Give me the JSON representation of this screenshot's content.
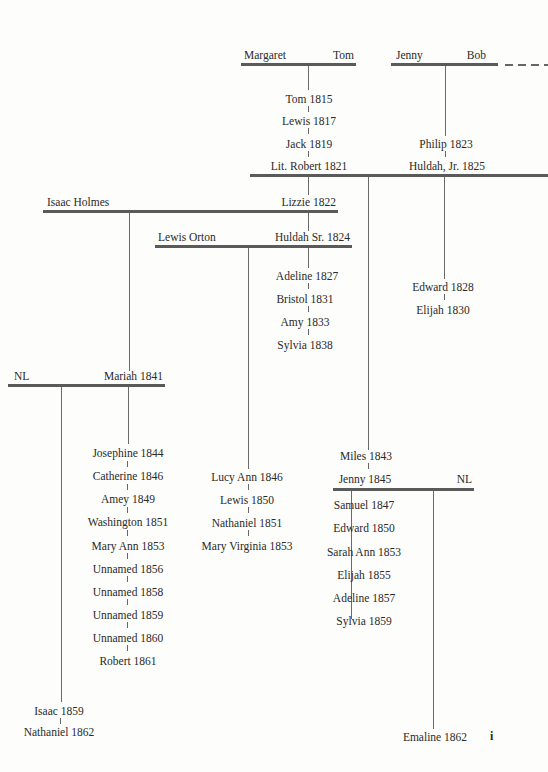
{
  "diagram": {
    "type": "family-tree",
    "couples": [
      {
        "id": "margaret-tom",
        "left": "Margaret",
        "right": "Tom"
      },
      {
        "id": "jenny-bob",
        "left": "Jenny",
        "right": "Bob"
      },
      {
        "id": "robert-huldahjr",
        "left": "Lit. Robert 1821",
        "right": "Huldah, Jr. 1825"
      },
      {
        "id": "isaac-lizzie",
        "left": "Isaac Holmes",
        "right": "Lizzie 1822"
      },
      {
        "id": "lewis-huldahsr",
        "left": "Lewis Orton",
        "right": "Huldah Sr. 1824"
      },
      {
        "id": "nl-mariah",
        "left": "NL",
        "right": "Mariah 1841"
      },
      {
        "id": "jenny-nl",
        "left": "Jenny 1845",
        "right": "NL"
      }
    ],
    "children_margaret_tom": [
      "Tom 1815",
      "Lewis 1817",
      "Jack 1819"
    ],
    "children_jenny_bob": [
      "Philip 1823"
    ],
    "children_huldah_sr": [
      "Adeline 1827",
      "Bristol 1831",
      "Amy 1833",
      "Sylvia 1838"
    ],
    "children_robert_huldahjr": [
      "Edward 1828",
      "Elijah 1830"
    ],
    "children_robert_other": [
      "Miles 1843"
    ],
    "children_mariah": [
      "Josephine 1844",
      "Catherine 1846",
      "Amey 1849",
      "Washington 1851",
      "Mary Ann 1853",
      "Unnamed 1856",
      "Unnamed 1858",
      "Unnamed 1859",
      "Unnamed 1860",
      "Robert 1861"
    ],
    "children_nl_mariah": [
      "Isaac 1859",
      "Nathaniel 1862"
    ],
    "children_lewis_orton": [
      "Lucy Ann 1846",
      "Lewis 1850",
      "Nathaniel 1851",
      "Mary Virginia 1853"
    ],
    "children_jenny_1845": [
      "Samuel 1847",
      "Edward 1850",
      "Sarah Ann 1853",
      "Elijah 1855",
      "Adeline 1857",
      "Sylvia 1859"
    ],
    "children_jenny_nl": [
      "Emaline 1862"
    ],
    "page_marker": "i"
  }
}
